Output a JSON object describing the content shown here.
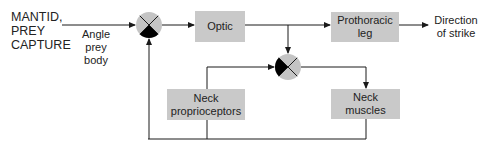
{
  "diagram": {
    "title_lines": [
      "MANTID,",
      "PREY",
      "CAPTURE"
    ],
    "input_label_lines": [
      "Angle",
      "prey",
      "body"
    ],
    "output_label_lines": [
      "Direction",
      "of strike"
    ],
    "boxes": {
      "optic": {
        "lines": [
          "Optic"
        ]
      },
      "prothoracic_leg": {
        "lines": [
          "Prothoracic",
          "leg"
        ]
      },
      "neck_proprioceptors": {
        "lines": [
          "Neck",
          "proprioceptors"
        ]
      },
      "neck_muscles": {
        "lines": [
          "Neck",
          "muscles"
        ]
      }
    },
    "junctions": [
      {
        "name": "summing-junction-1",
        "filled_quadrant": "bottom"
      },
      {
        "name": "summing-junction-2",
        "filled_quadrant": "left"
      }
    ],
    "colors": {
      "box_fill": "#c9c9c9",
      "junction_fill": "#c4c4c4",
      "junction_negative": "#000000",
      "line": "#1a1a1a",
      "text": "#222222"
    }
  }
}
